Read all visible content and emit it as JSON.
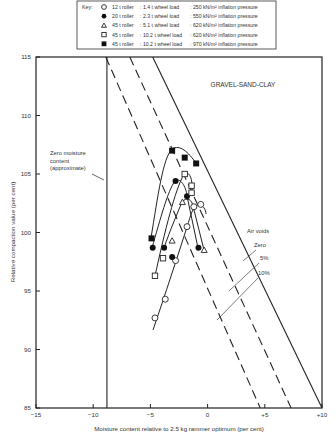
{
  "chart_data": {
    "type": "scatter",
    "title": "GRAVEL-SAND-CLAY",
    "xlabel": "Moisture content relative to 2.5 kg rammer optimum (per cent)",
    "ylabel": "Relative compaction value (per cent)",
    "xlim": [
      -15,
      10
    ],
    "ylim": [
      85,
      115
    ],
    "xticks": [
      -15,
      -10,
      -5,
      0,
      5,
      10
    ],
    "xtick_labels": [
      "−15",
      "−10",
      "−5",
      "0",
      "+5",
      "+10"
    ],
    "yticks": [
      85,
      90,
      95,
      100,
      105,
      110,
      115
    ],
    "grid": false,
    "legend_position": "top (outside plot, boxed)",
    "legend_title": "Key:",
    "series": [
      {
        "name": "12 t roller : 1.4 t wheel load : 250 kN/m² inflation pressure",
        "marker": "open-circle",
        "points": [
          [
            -4.6,
            92.7
          ],
          [
            -3.7,
            94.3
          ],
          [
            -2.8,
            97.6
          ],
          [
            -1.8,
            100.5
          ],
          [
            -1.2,
            102.2
          ],
          [
            -0.6,
            102.4
          ]
        ]
      },
      {
        "name": "20 t roller : 2.3 t wheel load : 550 kN/m² inflation pressure",
        "marker": "filled-circle",
        "points": [
          [
            -4.8,
            98.7
          ],
          [
            -3.8,
            98.7
          ],
          [
            -3.1,
            97.9
          ],
          [
            -2.8,
            104.4
          ],
          [
            -1.8,
            103.1
          ],
          [
            -0.8,
            98.7
          ]
        ]
      },
      {
        "name": "45 t roller : 5.1 t wheel load : 620 kN/m² inflation pressure",
        "marker": "open-triangle",
        "points": [
          [
            -3.1,
            99.3
          ],
          [
            -2.2,
            102.6
          ],
          [
            -0.3,
            98.5
          ]
        ]
      },
      {
        "name": "45 t roller : 10.2 t wheel load : 620 kN/m² inflation pressure",
        "marker": "open-square",
        "points": [
          [
            -4.6,
            96.3
          ],
          [
            -3.9,
            97.8
          ],
          [
            -2.0,
            105.0
          ],
          [
            -1.4,
            104.0
          ],
          [
            -1.4,
            103.4
          ]
        ]
      },
      {
        "name": "45 t roller : 10.2 t wheel load : 970 kN/m² inflation pressure",
        "marker": "filled-square",
        "points": [
          [
            -4.9,
            99.5
          ],
          [
            -3.1,
            107.0
          ],
          [
            -2.0,
            106.4
          ],
          [
            -1.0,
            105.9
          ]
        ]
      }
    ],
    "reference_lines": [
      {
        "name": "Zero moisture content (approximate)",
        "style": "solid-vertical",
        "x": -8.8
      },
      {
        "name": "Air voids Zero",
        "style": "solid",
        "from": [
          -4.8,
          115
        ],
        "to": [
          10,
          85
        ]
      },
      {
        "name": "Air voids 5%",
        "style": "dashed",
        "from": [
          -6.8,
          115
        ],
        "to": [
          7.3,
          85
        ]
      },
      {
        "name": "Air voids 10%",
        "style": "dashed",
        "from": [
          -8.9,
          115
        ],
        "to": [
          4.6,
          85
        ]
      }
    ],
    "annotations": [
      {
        "text": "Zero moisture content (approximate)",
        "x": -12.5,
        "y": 106
      },
      {
        "text": "Air voids",
        "x": 2.5,
        "y": 100
      },
      {
        "text": "Zero",
        "x": 3.2,
        "y": 98.8
      },
      {
        "text": "5%",
        "x": 4.0,
        "y": 97.5
      },
      {
        "text": "10%",
        "x": 4.0,
        "y": 96.0
      }
    ]
  },
  "legend": {
    "key_label": "Key:",
    "items": [
      {
        "marker": "open-circle",
        "roller": "12 t roller",
        "load": ": 1.4 t wheel load",
        "pressure": ": 250 kN/m² inflation pressure"
      },
      {
        "marker": "filled-circle",
        "roller": "20 t roller",
        "load": ": 2.3 t wheel load",
        "pressure": ": 550 kN/m² inflation pressure"
      },
      {
        "marker": "open-triangle",
        "roller": "45 t roller",
        "load": ": 5.1 t wheel load",
        "pressure": ": 620 kN/m² inflation pressure"
      },
      {
        "marker": "open-square",
        "roller": "45 t roller",
        "load": ": 10.2 t wheel load",
        "pressure": ": 620 kN/m² inflation pressure"
      },
      {
        "marker": "filled-square",
        "roller": "45 t roller",
        "load": ": 10.2 t wheel load",
        "pressure": ": 970 kN/m² inflation pressure"
      }
    ]
  }
}
